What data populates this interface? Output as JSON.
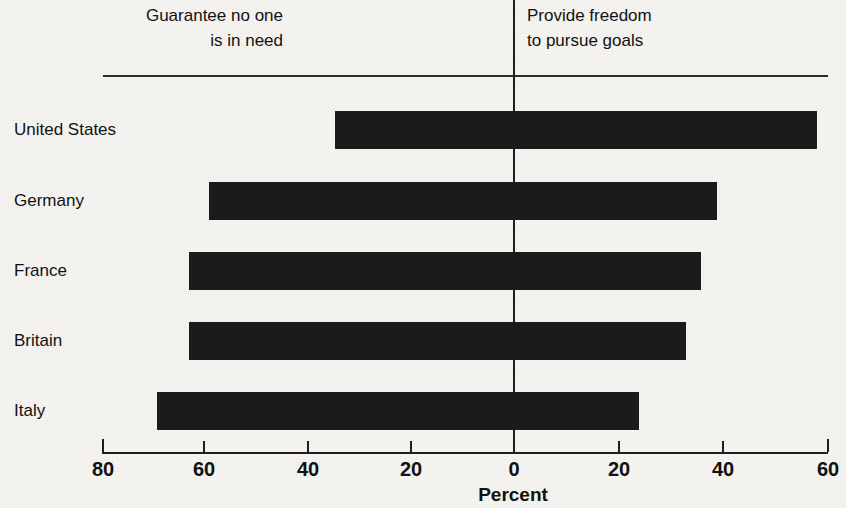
{
  "chart_data": {
    "type": "bar",
    "orientation": "horizontal",
    "style": "diverging-bar",
    "title": "",
    "xlabel": "Percent",
    "ylabel": "",
    "categories": [
      "United States",
      "Germany",
      "France",
      "Britain",
      "Italy"
    ],
    "series": [
      {
        "name": "Guarantee no one is in need",
        "side": "left",
        "values": [
          34,
          58,
          62,
          62,
          68
        ]
      },
      {
        "name": "Provide freedom to pursue goals",
        "side": "right",
        "values": [
          58,
          39,
          36,
          33,
          24
        ]
      }
    ],
    "axis": {
      "tick_labels": [
        "80",
        "60",
        "40",
        "20",
        "0",
        "20",
        "40",
        "60"
      ],
      "tick_values": [
        -80,
        -60,
        -40,
        -20,
        0,
        20,
        40,
        60
      ],
      "xlim": [
        -80,
        60
      ],
      "grid": false,
      "zero_line": true
    },
    "legend": {
      "position": "top",
      "entries": [
        "Guarantee no one\nis in need",
        "Provide freedom\nto pursue goals"
      ]
    },
    "colors": {
      "bar": "#1b1b1b",
      "axis": "#1e1e1e",
      "background": "#f4f3f0",
      "text": "#111111"
    }
  },
  "header": {
    "left_label": "Guarantee no one\nis in need",
    "right_label": "Provide freedom\nto pursue goals"
  },
  "axis": {
    "title": "Percent",
    "ticks": [
      {
        "label": "80",
        "x": 102
      },
      {
        "label": "60",
        "x": 203
      },
      {
        "label": "40",
        "x": 307
      },
      {
        "label": "20",
        "x": 410
      },
      {
        "label": "0",
        "x": 513
      },
      {
        "label": "20",
        "x": 618
      },
      {
        "label": "40",
        "x": 722
      },
      {
        "label": "60",
        "x": 827
      }
    ]
  },
  "rows": [
    {
      "label": "United States",
      "left": 34,
      "right": 58,
      "top": 95
    },
    {
      "label": "Germany",
      "left": 58,
      "right": 39,
      "top": 166
    },
    {
      "label": "France",
      "left": 62,
      "right": 36,
      "top": 236
    },
    {
      "label": "Britain",
      "left": 62,
      "right": 33,
      "top": 306
    },
    {
      "label": "Italy",
      "left": 68,
      "right": 24,
      "top": 376
    }
  ],
  "title_sliver": ""
}
